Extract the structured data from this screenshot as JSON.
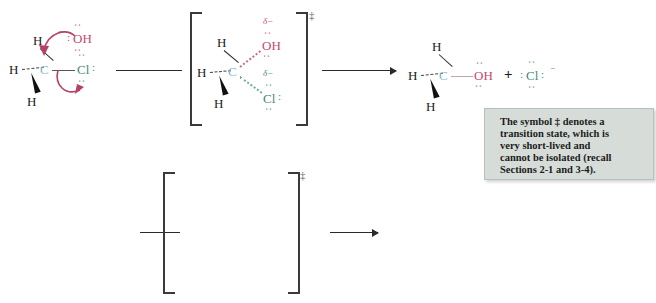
{
  "figure": {
    "rows": [
      {
        "id": "lewis-row",
        "label": "Lewis structure mechanism"
      },
      {
        "id": "model-row",
        "label": "Ball-and-stick model mechanism"
      }
    ]
  },
  "colors": {
    "background": "#ffffff",
    "carbon_text": "#7fb5c9",
    "oxygen_text": "#c44a6e",
    "chlorine_text": "#3f8a7a",
    "hydrogen_text": "#1a1a1a",
    "bond_line": "#2a2a2a",
    "curved_arrow": "#b5416b",
    "red_mech_arrow": "#cc2a16",
    "note_box_fill": "#d6ddd9",
    "note_box_border": "#b7c0bb",
    "ball_carbon": "#2e3560",
    "ball_hydrogen": "#f2f2f4",
    "ball_oxygen": "#d4502a",
    "ball_chlorine": "#a9cbb5",
    "dash_bond_red": "#c0341b",
    "dash_bond_green": "#1c6b4f"
  },
  "lewis": {
    "reactant": {
      "name": "chloromethane-plus-hydroxide",
      "central_atom": "C",
      "hydrogens": [
        "H",
        "H",
        "H"
      ],
      "nucleophile_label": "OH",
      "nucleophile_charge": "−",
      "leaving_group_label": "Cl",
      "lone_pair_dots": ":"
    },
    "transition_state": {
      "name": "sn2-transition-state",
      "central_atom": "C",
      "hydrogens": [
        "H",
        "H",
        "H"
      ],
      "partial_charge_top": "δ−",
      "partial_charge_bottom": "δ−",
      "top_group": "OH",
      "bottom_group": "Cl",
      "dagger": "‡"
    },
    "product": {
      "name": "methanol-plus-chloride",
      "central_atom": "C",
      "hydrogens": [
        "H",
        "H",
        "H"
      ],
      "product_group": "OH",
      "plus_sign": "+",
      "leaving_ion": "Cl",
      "leaving_ion_charge": "−"
    }
  },
  "models": {
    "reactant": {
      "name": "model-reactant",
      "atoms": [
        "C",
        "H",
        "H",
        "H",
        "Cl",
        "O",
        "H"
      ],
      "arrow_count": 2
    },
    "transition_state": {
      "name": "model-transition-state",
      "atoms": [
        "C",
        "H",
        "H",
        "H",
        "Cl",
        "O",
        "H"
      ],
      "dagger": "‡"
    },
    "product": {
      "name": "model-product",
      "atoms": [
        "C",
        "H",
        "H",
        "H",
        "O",
        "H"
      ],
      "free_ion": "Cl"
    }
  },
  "note": {
    "name": "transition-state-note",
    "lines": [
      "The symbol ‡ denotes a",
      "transition state, which is",
      "very short-lived and",
      "cannot be isolated (recall",
      "Sections 2-1 and 3-4)."
    ],
    "full_text": "The symbol ‡ denotes a transition state, which is very short-lived and cannot be isolated (recall Sections 2-1 and 3-4)."
  }
}
